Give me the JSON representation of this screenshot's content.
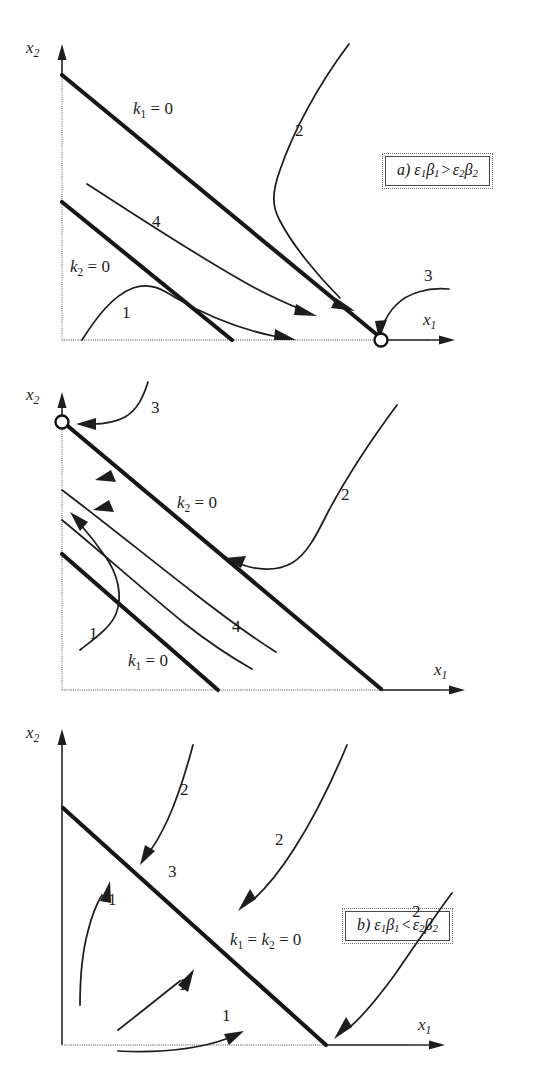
{
  "figure": {
    "type": "phase-plane-diagram",
    "panel_count": 3,
    "axis_labels": {
      "x": "x1",
      "y": "x2"
    },
    "stroke_colors": {
      "nullcline": "#161616",
      "trajectory": "#1d1d1d",
      "axis": "#262626",
      "equilibrium_fill": "#ffffff"
    }
  },
  "panels": [
    {
      "id": "a",
      "caption": {
        "letter": "a)",
        "lhs_eps": "ε",
        "lhs_eps_sub": "1",
        "lhs_beta": "β",
        "lhs_beta_sub": "1",
        "operator": ">",
        "rhs_eps": "ε",
        "rhs_eps_sub": "2",
        "rhs_beta": "β",
        "rhs_beta_sub": "2",
        "full_text": "a) ε1β1 > ε2β2"
      },
      "axis_x_label": "x",
      "axis_x_sub": "1",
      "axis_y_label": "x",
      "axis_y_sub": "2",
      "nullclines": [
        {
          "name": "k1",
          "label_k": "k",
          "label_sub": "1",
          "label_eq": "= 0",
          "label_text": "k1 = 0",
          "role": "upper-line"
        },
        {
          "name": "k2",
          "label_k": "k",
          "label_sub": "2",
          "label_eq": "= 0",
          "label_text": "k2 = 0",
          "role": "lower-line"
        }
      ],
      "trajectory_labels": [
        "1",
        "2",
        "3",
        "4"
      ],
      "equilibrium": {
        "shown": true,
        "position": "on-x-axis",
        "pointer_label": "3"
      }
    },
    {
      "id": "b",
      "caption": {
        "letter": "b)",
        "lhs_eps": "ε",
        "lhs_eps_sub": "1",
        "lhs_beta": "β",
        "lhs_beta_sub": "1",
        "operator": "<",
        "rhs_eps": "ε",
        "rhs_eps_sub": "2",
        "rhs_beta": "β",
        "rhs_beta_sub": "2",
        "full_text": "b) ε1β1 < ε2β2"
      },
      "axis_x_label": "x",
      "axis_x_sub": "1",
      "axis_y_label": "x",
      "axis_y_sub": "2",
      "nullclines": [
        {
          "name": "k2",
          "label_k": "k",
          "label_sub": "2",
          "label_eq": "= 0",
          "label_text": "k2 = 0",
          "role": "upper-line"
        },
        {
          "name": "k1",
          "label_k": "k",
          "label_sub": "1",
          "label_eq": "= 0",
          "label_text": "k1 = 0",
          "role": "lower-line"
        }
      ],
      "trajectory_labels": [
        "1",
        "2",
        "3",
        "4"
      ],
      "equilibrium": {
        "shown": true,
        "position": "on-y-axis",
        "pointer_label": "3"
      }
    },
    {
      "id": "c",
      "caption": {
        "letter": "c)",
        "lhs_eps": "ε",
        "lhs_eps_sub": "1",
        "lhs_beta": "β",
        "lhs_beta_sub": "1",
        "operator": "=",
        "rhs_eps": "ε",
        "rhs_eps_sub": "2",
        "rhs_beta": "β",
        "rhs_beta_sub": "2",
        "full_text": "c) ε1β1 = ε2β2"
      },
      "axis_x_label": "x",
      "axis_x_sub": "1",
      "axis_y_label": "x",
      "axis_y_sub": "2",
      "nullclines": [
        {
          "name": "k1k2",
          "label_k": "k",
          "label_sub": "1",
          "label_k_2": "k",
          "label_sub_2": "2",
          "label_eq": "= 0",
          "label_text": "k1 = k2 = 0",
          "role": "coincident-line"
        }
      ],
      "line_label": "3",
      "trajectory_labels": [
        "1",
        "1",
        "1",
        "2",
        "2",
        "2"
      ],
      "equilibrium": {
        "shown": false,
        "position": "none",
        "pointer_label": ""
      }
    }
  ]
}
